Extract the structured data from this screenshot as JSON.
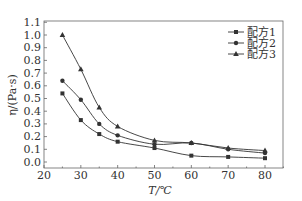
{
  "chart_data": {
    "type": "line",
    "title": "",
    "xlabel": "T/℃",
    "ylabel": "η/(Pa·s)",
    "xlim": [
      20,
      85
    ],
    "ylim": [
      -0.05,
      1.1
    ],
    "xticks": [
      20,
      30,
      40,
      50,
      60,
      70,
      80
    ],
    "yticks": [
      0.0,
      0.1,
      0.2,
      0.3,
      0.4,
      0.5,
      0.6,
      0.7,
      0.8,
      0.9,
      1.0,
      1.1
    ],
    "ytick_labels": [
      "0.0",
      "0.1",
      "0.2",
      "0.3",
      "0.4",
      "0.5",
      "0.6",
      "0.7",
      "0.8",
      "0.9",
      "1.0",
      "1.1"
    ],
    "grid": false,
    "legend_position": "top-right",
    "x": [
      25,
      30,
      35,
      40,
      50,
      60,
      70,
      80
    ],
    "series": [
      {
        "name": "配方1",
        "marker": "square",
        "values": [
          0.54,
          0.33,
          0.22,
          0.16,
          0.11,
          0.05,
          0.04,
          0.03
        ]
      },
      {
        "name": "配方2",
        "marker": "circle",
        "values": [
          0.64,
          0.49,
          0.3,
          0.21,
          0.14,
          0.15,
          0.1,
          0.07
        ]
      },
      {
        "name": "配方3",
        "marker": "triangle",
        "values": [
          1.0,
          0.73,
          0.43,
          0.28,
          0.17,
          0.15,
          0.11,
          0.09
        ]
      }
    ]
  },
  "colors": {
    "line": "#333333",
    "axis": "#666666"
  }
}
